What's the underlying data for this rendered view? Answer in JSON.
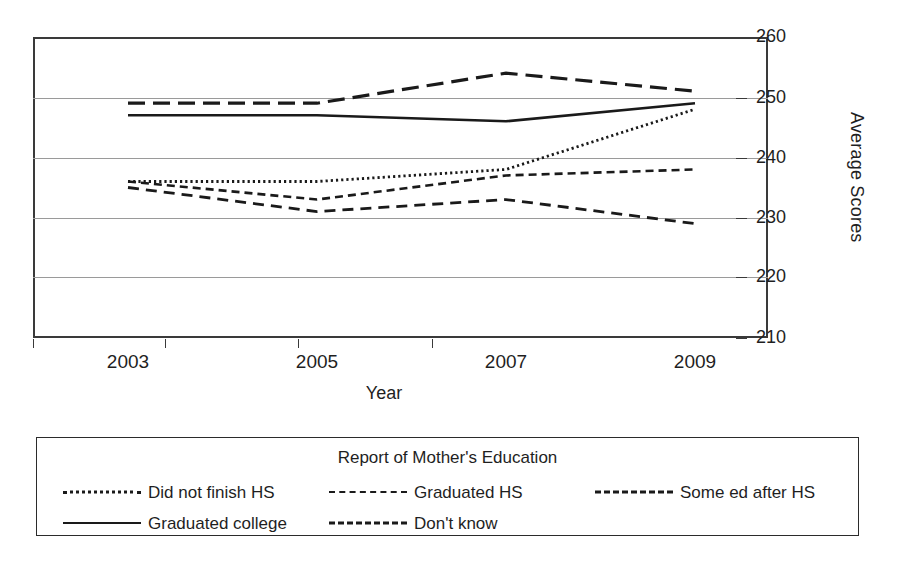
{
  "chart_data": {
    "type": "line",
    "title": "",
    "xlabel": "Year",
    "ylabel": "Average Scores",
    "categories": [
      "2003",
      "2005",
      "2007",
      "2009"
    ],
    "x": [
      2003,
      2005,
      2007,
      2009
    ],
    "ylim": [
      210,
      260
    ],
    "yticks": [
      210,
      220,
      230,
      240,
      250,
      260
    ],
    "grid": true,
    "legend_position": "bottom",
    "legend_title": "Report of Mother's Education",
    "series": [
      {
        "name": "Did not finish HS",
        "style": "dotted",
        "values": [
          236,
          236,
          238,
          248
        ]
      },
      {
        "name": "Graduated HS",
        "style": "dashed-small",
        "values": [
          236,
          233,
          237,
          238
        ]
      },
      {
        "name": "Some ed after HS",
        "style": "dashed-large",
        "values": [
          249,
          249,
          254,
          251
        ]
      },
      {
        "name": "Graduated college",
        "style": "solid",
        "values": [
          247,
          247,
          246,
          249
        ]
      },
      {
        "name": "Don't know",
        "style": "dashed-medium",
        "values": [
          235,
          231,
          233,
          229
        ]
      }
    ]
  },
  "axis": {
    "y_tick_labels": [
      "260",
      "250",
      "240",
      "230",
      "220",
      "210"
    ],
    "y_axis_title": "Average Scores",
    "x_tick_labels": [
      "2003",
      "2005",
      "2007",
      "2009"
    ],
    "x_axis_title": "Year"
  },
  "legend": {
    "title": "Report of Mother's Education",
    "entries": [
      {
        "label": "Did not finish HS",
        "style": "dotted"
      },
      {
        "label": "Graduated HS",
        "style": "dashed-small"
      },
      {
        "label": "Some ed after HS",
        "style": "dashed-large"
      },
      {
        "label": "Graduated college",
        "style": "solid"
      },
      {
        "label": "Don't know",
        "style": "dashed-medium"
      }
    ]
  },
  "colors": {
    "line": "#1a1a1a",
    "grid": "#9a9a9a",
    "frame": "#3a3a3a",
    "text": "#1f1f1f",
    "background": "#ffffff"
  }
}
